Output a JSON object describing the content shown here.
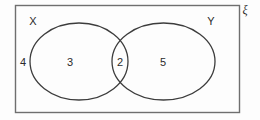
{
  "figure": {
    "kind": "venn-diagram",
    "universal_set": {
      "symbol": "ξ",
      "name": "universal-set-symbol"
    },
    "sets": [
      {
        "id": "X",
        "label": "X",
        "position": "left"
      },
      {
        "id": "Y",
        "label": "Y",
        "position": "right"
      }
    ],
    "regions": [
      {
        "id": "outside",
        "label": "4",
        "description": "outside both X and Y"
      },
      {
        "id": "x-only",
        "label": "3",
        "description": "X only"
      },
      {
        "id": "intersection",
        "label": "2",
        "description": "X intersect Y"
      },
      {
        "id": "y-only",
        "label": "5",
        "description": "Y only"
      }
    ],
    "colors": {
      "stroke": "#3c3c3c",
      "rect_stroke": "#6f6f6f",
      "text": "#2b2b2b",
      "background": "#fdfdfd"
    }
  }
}
